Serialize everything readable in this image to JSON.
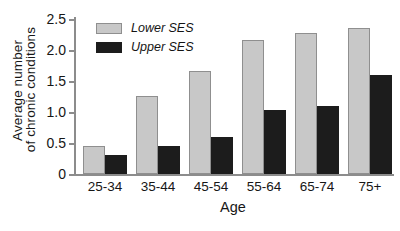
{
  "chart_data": {
    "type": "bar",
    "title": "",
    "xlabel": "Age",
    "ylabel_lines": [
      "Average number",
      "of chronic conditions"
    ],
    "ylabel": "Average number of chronic conditions",
    "categories": [
      "25-34",
      "35-44",
      "45-54",
      "55-64",
      "65-74",
      "75+"
    ],
    "series": [
      {
        "name": "Lower SES",
        "color": "#c8c8c8",
        "edge_color": "#8f8f8f",
        "values": [
          0.45,
          1.26,
          1.66,
          2.16,
          2.27,
          2.35
        ]
      },
      {
        "name": "Upper SES",
        "color": "#1c1c1c",
        "edge_color": "#1c1c1c",
        "values": [
          0.31,
          0.45,
          0.6,
          1.04,
          1.09,
          1.59
        ]
      }
    ],
    "ylim": [
      0,
      2.5
    ],
    "yticks": [
      0,
      0.5,
      1.0,
      1.5,
      2.0,
      2.5
    ],
    "ytick_labels": [
      "0",
      "0.5",
      "1.0",
      "1.5",
      "2.0",
      "2.5"
    ],
    "grid": false,
    "legend_position": "upper left",
    "legend_entries": [
      "Lower SES",
      "Upper SES"
    ]
  }
}
